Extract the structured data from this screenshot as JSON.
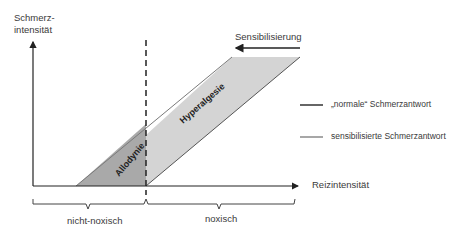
{
  "y_axis": {
    "label_line1": "Schmerz-",
    "label_line2": "intensität"
  },
  "x_axis": {
    "label": "Reizintensität"
  },
  "arrow_label": "Sensibilisierung",
  "regions": {
    "allodynie": "Allodynie",
    "hyperalgesie": "Hyperalgesie"
  },
  "brackets": {
    "left": "nicht-noxisch",
    "right": "noxisch"
  },
  "legend": [
    {
      "label": "„normale“ Schmerzantwort",
      "color": "#333333"
    },
    {
      "label": "sensibilisierte Schmerzantwort",
      "color": "#8a8a8a"
    }
  ],
  "colors": {
    "allodynie_fill": "#a9a9a9",
    "hyperalgesie_fill": "#d4d4d4",
    "axis": "#222222"
  }
}
